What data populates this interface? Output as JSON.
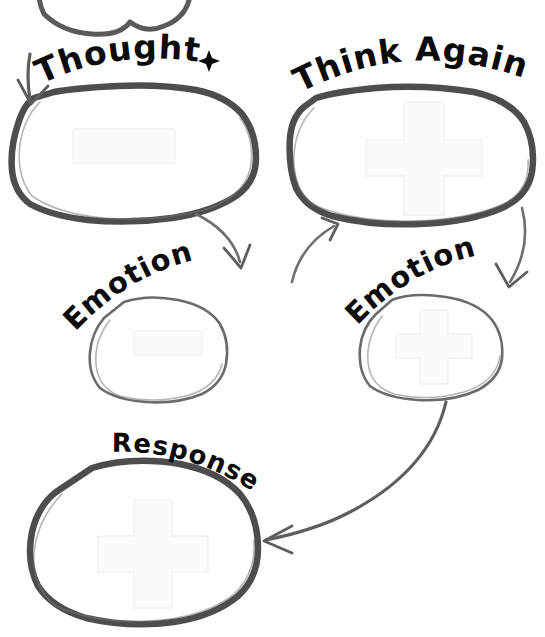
{
  "diagram": {
    "background_color": "#ffffff",
    "ink_color": "#4a4a4a",
    "text_color": "#0a0a0a",
    "watermark_color": "#f6f6f6",
    "nodes": [
      {
        "id": "partial-top",
        "label": "",
        "note": "partial bubble cut off by top edge",
        "has_watermark": false
      },
      {
        "id": "thought",
        "label": "Thought",
        "label_position": "arched-above-left",
        "has_watermark": true,
        "watermark": "cross"
      },
      {
        "id": "think-again",
        "label": "Think Again",
        "label_position": "arched-above-right",
        "has_watermark": true,
        "watermark": "cross"
      },
      {
        "id": "emotion-left",
        "label": "Emotion",
        "label_position": "arched-upward-left",
        "has_watermark": true,
        "watermark": "cross"
      },
      {
        "id": "emotion-right",
        "label": "Emotion",
        "label_position": "arched-upward-right",
        "has_watermark": true,
        "watermark": "cross"
      },
      {
        "id": "response",
        "label": "Response",
        "label_position": "arched-descending",
        "has_watermark": true,
        "watermark": "cross"
      }
    ],
    "connectors": [
      {
        "id": "arrow-into-thought",
        "from": "partial-top",
        "to": "thought",
        "style": "short-straight-down-left"
      },
      {
        "id": "arrow-thought-to-emotion-left",
        "from": "thought",
        "to": "emotion-left",
        "style": "curve-down-right"
      },
      {
        "id": "arrow-thought-to-think-again",
        "from": "emotion-left",
        "to": "think-again",
        "style": "curve-up-right"
      },
      {
        "id": "arrow-think-again-to-emotion-right",
        "from": "think-again",
        "to": "emotion-right",
        "style": "curve-down"
      },
      {
        "id": "arrow-emotion-right-to-response",
        "from": "emotion-right",
        "to": "response",
        "style": "long-sweep-down-left"
      }
    ]
  }
}
